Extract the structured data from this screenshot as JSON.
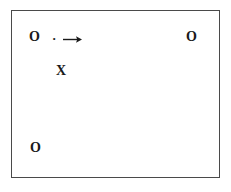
{
  "figure": {
    "background_color": "#ffffff",
    "border_color": "#4a4a4a",
    "ink_color": "#1a1a1a"
  },
  "frame": {
    "label": "diagram-border"
  },
  "marks": [
    {
      "id": "o-topleft",
      "symbol": "O",
      "kind": "letter",
      "position": "top-left"
    },
    {
      "id": "dot-top",
      "symbol": "·",
      "kind": "dot",
      "position": "top-left-inner"
    },
    {
      "id": "arrow-top",
      "symbol": "→",
      "kind": "arrow",
      "direction": "right",
      "position": "top-left-inner"
    },
    {
      "id": "o-topright",
      "symbol": "O",
      "kind": "letter",
      "position": "top-right"
    },
    {
      "id": "x-mid",
      "symbol": "X",
      "kind": "letter",
      "position": "upper-left-center"
    },
    {
      "id": "o-botleft",
      "symbol": "O",
      "kind": "letter",
      "position": "bottom-left"
    }
  ]
}
